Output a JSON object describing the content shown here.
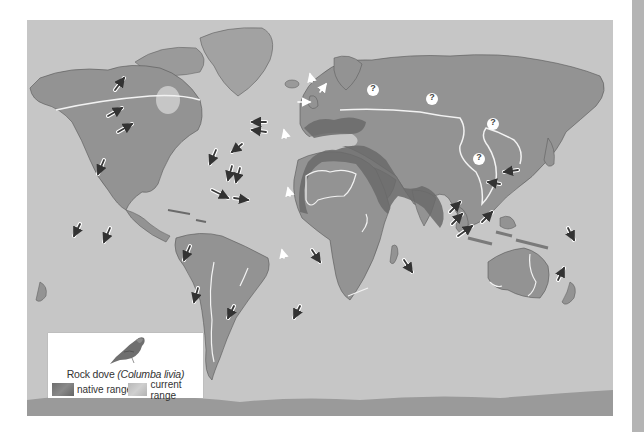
{
  "map": {
    "subject": "Rock dove distribution",
    "background_color": "#c6c6c6",
    "land_color": "#959595",
    "native_range_color": "#6a6a6a",
    "current_range_border_color": "#f2f2f2",
    "unknown_markers": [
      {
        "id": "q1",
        "label": "?",
        "x": 373,
        "y": 90
      },
      {
        "id": "q2",
        "label": "?",
        "x": 432,
        "y": 99
      },
      {
        "id": "q3",
        "label": "?",
        "x": 493,
        "y": 124
      },
      {
        "id": "q4",
        "label": "?",
        "x": 479,
        "y": 159
      }
    ],
    "introduction_arrows_count": 36
  },
  "legend": {
    "title_common": "Rock dove ",
    "title_scientific": "(Columba livia)",
    "items": [
      {
        "label": "native range",
        "swatch": "native"
      },
      {
        "label": "current range",
        "swatch": "current"
      }
    ]
  },
  "scrollbar": {
    "color": "#b4b4b4"
  }
}
